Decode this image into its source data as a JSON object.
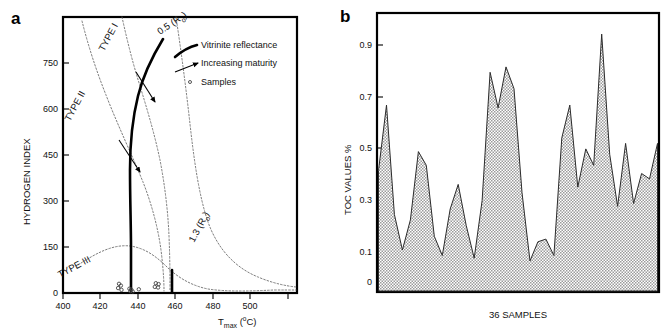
{
  "figure": {
    "panel_a_letter": "a",
    "panel_b_letter": "b"
  },
  "panel_a": {
    "name": "van-krevelen-hi-tmax-diagram",
    "y_axis": {
      "title": "HYDROGEN INDEX",
      "ticks": [
        0,
        150,
        300,
        450,
        600,
        750
      ],
      "tick_labels": [
        "0",
        "150",
        "300",
        "450",
        "600",
        "750"
      ],
      "range": [
        0,
        900
      ]
    },
    "x_axis": {
      "title_main": "T",
      "title_sub": "max",
      "title_unit_open": " (",
      "title_unit_deg": "o",
      "title_unit_c": "C)",
      "title_plain": "Tmax (oC)",
      "ticks": [
        400,
        420,
        440,
        460,
        480,
        500
      ],
      "tick_labels": [
        "400",
        "420",
        "440",
        "460",
        "480",
        "500"
      ],
      "range": [
        400,
        525
      ]
    },
    "kerogen_labels": [
      {
        "text": "TYPE I",
        "x": 104,
        "y": 52,
        "rotation": -62
      },
      {
        "text": "TYPE II",
        "x": 70,
        "y": 122,
        "rotation": -62
      },
      {
        "text": "TYPE III",
        "x": 60,
        "y": 278,
        "rotation": -28
      }
    ],
    "ro_labels": [
      {
        "text": "0.5 (R",
        "sub": "o",
        "tail": ")",
        "x": 163,
        "y": 32,
        "rotation": -34
      },
      {
        "text": "1.3 (R",
        "sub": "o",
        "tail": ")",
        "x": 196,
        "y": 237,
        "rotation": -62
      }
    ],
    "legend": [
      {
        "icon": "thick-line-swatch",
        "label": "Vitrinite reflectance"
      },
      {
        "icon": "arrow-swatch",
        "label": "Increasing maturity"
      },
      {
        "icon": "circle-swatch",
        "label": "Samples"
      }
    ],
    "samples": [
      {
        "tmax": 429.5,
        "hi": 30
      },
      {
        "tmax": 430.5,
        "hi": 24
      },
      {
        "tmax": 429.0,
        "hi": 16
      },
      {
        "tmax": 430.8,
        "hi": 10
      },
      {
        "tmax": 435.0,
        "hi": 14
      },
      {
        "tmax": 436.0,
        "hi": 11
      },
      {
        "tmax": 435.5,
        "hi": 6
      },
      {
        "tmax": 436.8,
        "hi": 5
      },
      {
        "tmax": 440.0,
        "hi": 12
      },
      {
        "tmax": 449.0,
        "hi": 32
      },
      {
        "tmax": 450.5,
        "hi": 29
      },
      {
        "tmax": 448.5,
        "hi": 20
      },
      {
        "tmax": 450.2,
        "hi": 18
      }
    ]
  },
  "panel_b": {
    "name": "toc-values-area-chart",
    "y_axis": {
      "title": "TOC VALUES %",
      "tick_labels": [
        "0.9",
        "0.7",
        "0.5",
        "0.3",
        "0.1",
        "0"
      ],
      "ticks": [
        0.9,
        0.7,
        0.5,
        0.3,
        0.1,
        0
      ]
    },
    "x_axis": {
      "title": "36 SAMPLES"
    }
  },
  "chart_data": [
    {
      "type": "scatter",
      "title": "Hydrogen Index vs Tmax (modified van Krevelen)",
      "xlabel": "Tmax (°C)",
      "ylabel": "HYDROGEN INDEX",
      "xlim": [
        400,
        525
      ],
      "ylim": [
        0,
        900
      ],
      "grid": false,
      "legend": [
        "Vitrinite reflectance",
        "Increasing maturity",
        "Samples"
      ],
      "annotations": [
        "TYPE I",
        "TYPE II",
        "TYPE III",
        "0.5 (Ro)",
        "1.3 (Ro)"
      ],
      "series": [
        {
          "name": "Samples",
          "x": [
            429.5,
            430.5,
            429.0,
            430.8,
            435.0,
            436.0,
            435.5,
            436.8,
            440.0,
            449.0,
            450.5,
            448.5,
            450.2
          ],
          "y": [
            30,
            24,
            16,
            10,
            14,
            11,
            6,
            5,
            12,
            32,
            29,
            20,
            18
          ]
        }
      ]
    },
    {
      "type": "area",
      "title": "TOC values of 36 samples",
      "xlabel": "36 SAMPLES",
      "ylabel": "TOC VALUES %",
      "xlim": [
        1,
        36
      ],
      "ylim": [
        0,
        1.0
      ],
      "grid": false,
      "categories": [
        "1",
        "2",
        "3",
        "4",
        "5",
        "6",
        "7",
        "8",
        "9",
        "10",
        "11",
        "12",
        "13",
        "14",
        "15",
        "16",
        "17",
        "18",
        "19",
        "20",
        "21",
        "22",
        "23",
        "24",
        "25",
        "26",
        "27",
        "28",
        "29",
        "30",
        "31",
        "32",
        "33",
        "34",
        "35",
        "36"
      ],
      "values": [
        0.44,
        0.68,
        0.28,
        0.15,
        0.26,
        0.51,
        0.46,
        0.2,
        0.13,
        0.3,
        0.39,
        0.24,
        0.12,
        0.33,
        0.8,
        0.67,
        0.82,
        0.74,
        0.36,
        0.11,
        0.18,
        0.19,
        0.13,
        0.56,
        0.68,
        0.38,
        0.52,
        0.46,
        0.94,
        0.5,
        0.31,
        0.54,
        0.32,
        0.43,
        0.41,
        0.54
      ],
      "ylabel_ticks": [
        "0",
        "0.1",
        "0.3",
        "0.5",
        "0.7",
        "0.9"
      ]
    }
  ]
}
